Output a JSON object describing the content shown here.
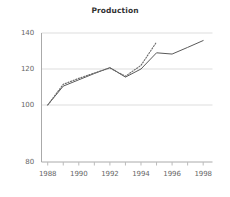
{
  "chart_data": {
    "type": "line",
    "title": "Production",
    "xlabel": "",
    "ylabel": "",
    "xlim": [
      1987.6,
      1998.6
    ],
    "ylim": [
      80,
      142
    ],
    "grid": true,
    "grid_axis": "y",
    "legend": "none",
    "x_tick_labels": [
      "1988",
      "1990",
      "1992",
      "1994",
      "1996",
      "1998"
    ],
    "x_tick_values": [
      1988,
      1990,
      1992,
      1994,
      1996,
      1998
    ],
    "x_minor_ticks": [
      1988,
      1989,
      1990,
      1991,
      1992,
      1993,
      1994,
      1995,
      1996,
      1997,
      1998
    ],
    "y_tick_labels": [
      "80",
      "100",
      "120",
      "140"
    ],
    "y_tick_values": [
      80,
      100,
      120,
      140
    ],
    "series": [
      {
        "name": "actual",
        "style": "solid",
        "color": "#595959",
        "x": [
          1988,
          1989,
          1990,
          1991,
          1992,
          1993,
          1994,
          1995,
          1996,
          1997,
          1998
        ],
        "values": [
          100.0,
          110.5,
          114.0,
          117.5,
          120.8,
          115.5,
          120.0,
          129.0,
          128.3,
          132.0,
          135.8
        ]
      },
      {
        "name": "trend",
        "style": "dotted",
        "color": "#6b6b6b",
        "x": [
          1988,
          1989,
          1990,
          1991,
          1992,
          1993,
          1994,
          1995
        ],
        "values": [
          100.0,
          111.5,
          114.8,
          117.8,
          120.5,
          116.0,
          122.0,
          135.0
        ]
      }
    ]
  },
  "axis": {
    "line_color": "#aaaaaa",
    "grid_color": "#dddddd",
    "tick_color": "#bbbbbb"
  }
}
